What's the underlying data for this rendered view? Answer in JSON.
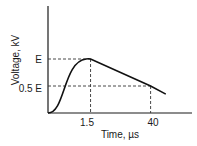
{
  "chart_data": {
    "type": "line",
    "title": "",
    "xlabel": "Time, µs",
    "ylabel": "Voltage, kV",
    "x_ticks": [
      "1.5",
      "40"
    ],
    "y_ticks": [
      "E",
      "0.5 E"
    ],
    "annotations": {
      "peak": {
        "time_label": "1.5",
        "voltage_label": "E",
        "voltage_fraction": 1.0
      },
      "half_value": {
        "time_label": "40",
        "voltage_label": "0.5 E",
        "voltage_fraction": 0.5
      }
    },
    "series": [
      {
        "name": "impulse-voltage",
        "points_normalized": [
          {
            "t": 0.0,
            "v": 0.0
          },
          {
            "t": 0.2,
            "v": 0.1
          },
          {
            "t": 0.5,
            "v": 0.55
          },
          {
            "t": 0.8,
            "v": 0.92
          },
          {
            "t": 1.0,
            "v": 1.0
          },
          {
            "t": 1.12,
            "v": 1.0
          },
          {
            "t": 2.7,
            "v": 0.5
          },
          {
            "t": 3.1,
            "v": 0.35
          }
        ]
      }
    ],
    "grid": false,
    "legend": "none"
  }
}
